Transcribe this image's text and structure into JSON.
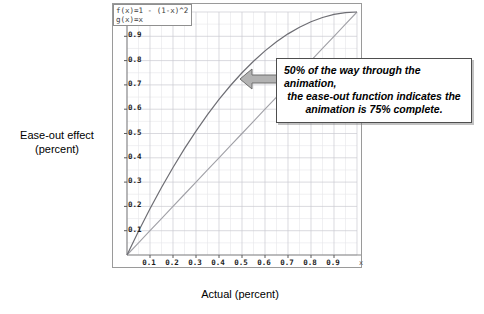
{
  "axis_titles": {
    "y_line1": "Ease-out effect",
    "y_line2": "(percent)",
    "x": "Actual (percent)"
  },
  "legend": {
    "entries": [
      "f(x)=1 - (1-x)^2",
      "g(x)=x"
    ]
  },
  "callout": {
    "line1": "50% of the way through the animation,",
    "line2": "the ease-out function indicates the",
    "line3": "animation is 75% complete.",
    "arrow_icon": "left-arrow-icon"
  },
  "colors": {
    "grid_minor": "#e4e4e8",
    "grid_major": "#c9c9d0",
    "axis": "#8a8a8a",
    "curve_ease_out": "#6e6e74",
    "curve_linear": "#9a9aa0",
    "arrow_fill": "#b0b0b0",
    "arrow_stroke": "#6a6a6a",
    "frame": "#9a9a9a",
    "text": "#000000"
  },
  "chart_data": {
    "type": "line",
    "title": "",
    "xlabel": "Actual (percent)",
    "ylabel": "Ease-out effect (percent)",
    "xlim": [
      0,
      1
    ],
    "ylim": [
      0,
      1
    ],
    "xticks": [
      0.1,
      0.2,
      0.3,
      0.4,
      0.5,
      0.6,
      0.7,
      0.8,
      0.9
    ],
    "yticks": [
      0.1,
      0.2,
      0.3,
      0.4,
      0.5,
      0.6,
      0.7,
      0.8,
      0.9
    ],
    "xtick_labels": [
      "0.1",
      "0.2",
      "0.3",
      "0.4",
      "0.5",
      "0.6",
      "0.7",
      "0.8",
      "0.9"
    ],
    "ytick_labels": [
      "0.1",
      "0.2",
      "0.3",
      "0.4",
      "0.5",
      "0.6",
      "0.7",
      "0.8",
      "0.9"
    ],
    "x_axis_variable": "x",
    "grid": true,
    "grid_minor_step": 0.05,
    "grid_major_step": 0.1,
    "legend_position": "top-left",
    "x": [
      0,
      0.05,
      0.1,
      0.15,
      0.2,
      0.25,
      0.3,
      0.35,
      0.4,
      0.45,
      0.5,
      0.55,
      0.6,
      0.65,
      0.7,
      0.75,
      0.8,
      0.85,
      0.9,
      0.95,
      1
    ],
    "series": [
      {
        "name": "f(x)=1 - (1-x)^2",
        "values": [
          0,
          0.0975,
          0.19,
          0.2775,
          0.36,
          0.4375,
          0.51,
          0.5775,
          0.64,
          0.6975,
          0.75,
          0.7975,
          0.84,
          0.8775,
          0.91,
          0.9375,
          0.96,
          0.9775,
          0.99,
          0.9975,
          1
        ]
      },
      {
        "name": "g(x)=x",
        "values": [
          0,
          0.05,
          0.1,
          0.15,
          0.2,
          0.25,
          0.3,
          0.35,
          0.4,
          0.45,
          0.5,
          0.55,
          0.6,
          0.65,
          0.7,
          0.75,
          0.8,
          0.85,
          0.9,
          0.95,
          1
        ]
      }
    ],
    "annotations": [
      {
        "text": "50% of the way through the animation, the ease-out function indicates the animation is 75% complete.",
        "points_to": [
          0.5,
          0.75
        ]
      }
    ]
  }
}
